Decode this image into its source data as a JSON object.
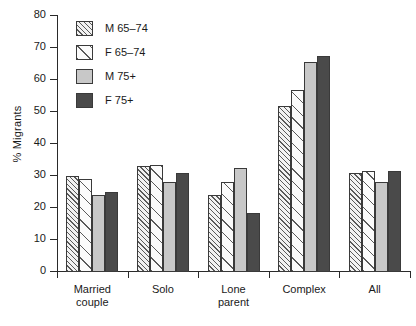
{
  "chart_data": {
    "type": "bar",
    "title": "",
    "xlabel": "",
    "ylabel": "% Migrants",
    "ylim": [
      0,
      80
    ],
    "yticks": [
      0,
      10,
      20,
      30,
      40,
      50,
      60,
      70,
      80
    ],
    "grid": false,
    "legend_position": "top-left",
    "categories": [
      "Married couple",
      "Solo",
      "Lone parent",
      "Complex",
      "All"
    ],
    "series": [
      {
        "name": "M 65–74",
        "values": [
          30,
          33,
          24,
          52,
          31
        ]
      },
      {
        "name": "F 65–74",
        "values": [
          29,
          33.5,
          28,
          57,
          31.5
        ]
      },
      {
        "name": "M 75+",
        "values": [
          24,
          28,
          32.5,
          65.5,
          28
        ]
      },
      {
        "name": "F 75+",
        "values": [
          25,
          31,
          18.5,
          67.5,
          31.5
        ]
      }
    ],
    "series_styles": [
      "sw-m6574",
      "sw-f6574",
      "sw-m75",
      "sw-f75"
    ],
    "colors": {
      "m_65_74": "#f2f2f2",
      "f_65_74": "#fbfbfb",
      "m_75plus": "#c8c8c8",
      "f_75plus": "#4a4a4a",
      "axis": "#2a2a2a",
      "bar_outline": "#3a3a3a",
      "background": "#ffffff"
    }
  }
}
